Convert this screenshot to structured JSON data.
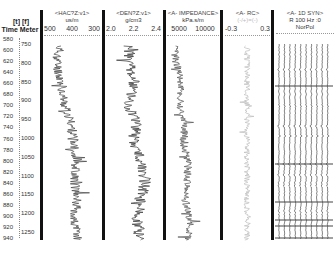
{
  "depth_header": {
    "units_line": "[t] [f]",
    "title_line": "Time Meter"
  },
  "depth_axis": {
    "time_labels": [
      "580",
      "600",
      "620",
      "640",
      "660",
      "680",
      "700",
      "720",
      "740",
      "760",
      "780",
      "800",
      "820",
      "840",
      "860",
      "880",
      "900",
      "920",
      "940"
    ],
    "meter_labels": [
      "750",
      "800",
      "850",
      "900",
      "950",
      "1000",
      "1050",
      "1100",
      "1150",
      "1200",
      "1250"
    ]
  },
  "tracks": [
    {
      "name": "<HAC?Z:v1>",
      "unit": "us/m",
      "scale": [
        "500",
        "400",
        "300"
      ]
    },
    {
      "name": "<DEN?Z:v1>",
      "unit": "g/cm3",
      "scale": [
        "2.0",
        "2.2",
        "2.4"
      ]
    },
    {
      "name": "<A- IMPEDANCE>",
      "unit": "kPa.s/m",
      "scale": [
        "5000",
        "10000"
      ]
    },
    {
      "name": "<A- RC>",
      "unit": "(-/+)=(-)",
      "scale": [
        "-0.3",
        "0.3"
      ]
    },
    {
      "name": "<A- 1D SYN>",
      "unit": "R 100 Hz :0",
      "scale": [
        "NorPol"
      ]
    }
  ],
  "chart_data": {
    "type": "line",
    "y_axis": {
      "label": "Time / Meter",
      "time_range": [
        580,
        945
      ],
      "depth_range": [
        740,
        1260
      ],
      "inverted": true
    },
    "series": [
      {
        "name": "HAC (sonic)",
        "unit": "us/m",
        "xlim": [
          500,
          250
        ],
        "depth": [
          750,
          800,
          850,
          900,
          950,
          1000,
          1050,
          1100,
          1150,
          1200,
          1250
        ],
        "values": [
          430,
          440,
          420,
          410,
          380,
          370,
          360,
          365,
          355,
          370,
          350
        ]
      },
      {
        "name": "DEN (density)",
        "unit": "g/cm3",
        "xlim": [
          2.0,
          2.5
        ],
        "depth": [
          750,
          800,
          850,
          900,
          950,
          1000,
          1050,
          1100,
          1150,
          1200,
          1250
        ],
        "values": [
          2.2,
          2.22,
          2.25,
          2.2,
          2.28,
          2.24,
          2.32,
          2.35,
          2.3,
          2.28,
          2.3
        ]
      },
      {
        "name": "A- IMPEDANCE",
        "unit": "kPa.s/m",
        "xlim": [
          4000,
          12000
        ],
        "depth": [
          750,
          800,
          850,
          900,
          950,
          1000,
          1050,
          1100,
          1150,
          1200,
          1250
        ],
        "values": [
          5200,
          5600,
          6300,
          6000,
          6800,
          6600,
          7300,
          7100,
          6900,
          7600,
          7200
        ]
      },
      {
        "name": "A- RC",
        "unit": "",
        "xlim": [
          -0.3,
          0.3
        ],
        "depth": [
          750,
          1250
        ],
        "values": [
          0,
          0
        ]
      },
      {
        "name": "A- 1D SYN",
        "unit": "R 100 Hz",
        "type": "wiggle",
        "traces": 10
      }
    ]
  }
}
